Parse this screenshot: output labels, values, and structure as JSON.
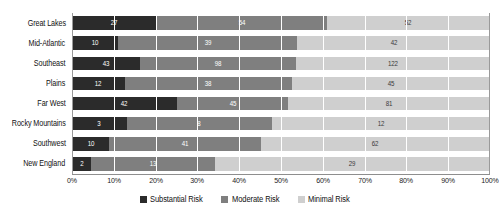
{
  "chart_data": {
    "type": "bar",
    "subtype": "stacked-horizontal-100percent",
    "title": "",
    "xlabel": "",
    "ylabel": "",
    "orientation": "horizontal",
    "stacked": true,
    "normalized": true,
    "grid": true,
    "legend_position": "bottom-center",
    "xlim": [
      0,
      100
    ],
    "xticks": [
      "0%",
      "10%",
      "20%",
      "30%",
      "40%",
      "50%",
      "60%",
      "70%",
      "80%",
      "90%",
      "100%"
    ],
    "categories": [
      "Great Lakes",
      "Mid-Atlantic",
      "Southeast",
      "Plains",
      "Far West",
      "Rocky Mountains",
      "Southwest",
      "New England"
    ],
    "series": [
      {
        "name": "Substantial Risk",
        "color": "#2b2b2b",
        "values": [
          27,
          10,
          43,
          12,
          42,
          3,
          10,
          2
        ]
      },
      {
        "name": "Moderate Risk",
        "color": "#7f7f7f",
        "values": [
          54,
          39,
          98,
          38,
          45,
          8,
          41,
          13
        ]
      },
      {
        "name": "Minimal Risk",
        "color": "#cfcfcf",
        "values": [
          52,
          42,
          122,
          45,
          81,
          12,
          62,
          29
        ]
      }
    ]
  },
  "legend": {
    "items": [
      {
        "label": "Substantial Risk",
        "color": "#2b2b2b"
      },
      {
        "label": "Moderate Risk",
        "color": "#7f7f7f"
      },
      {
        "label": "Minimal Risk",
        "color": "#cfcfcf"
      }
    ]
  },
  "colors": {
    "substantial": "#2b2b2b",
    "moderate": "#7f7f7f",
    "minimal": "#cfcfcf",
    "gridline": "#ffffff",
    "axis": "#8e8e8e",
    "background": "#ffffff"
  }
}
